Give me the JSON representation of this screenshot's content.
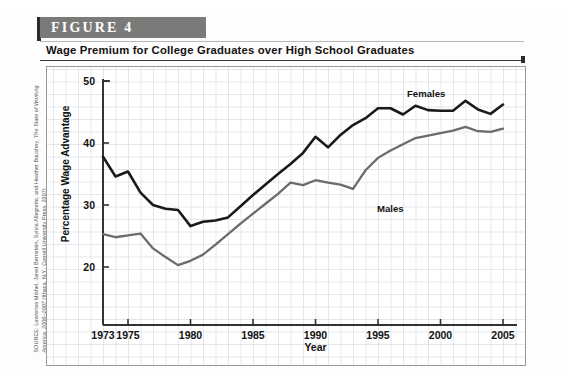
{
  "figure": {
    "banner_label": "FIGURE  4",
    "caption": "Wage Premium for College Graduates over High School Graduates"
  },
  "source": {
    "prefix": "SOURCE: Lawrence Mishel, Jared Bernstein, Sylvia Allegretto, and Heather Boushey, ",
    "italic_title": "The State of Working America, 2006–2007",
    "suffix": " (Ithaca, N.Y.: Cornell University Press, 2007)"
  },
  "chart_data": {
    "type": "line",
    "title": "Wage Premium for College Graduates over High School Graduates",
    "xlabel": "Year",
    "ylabel": "Percentage Wage Advantage",
    "xlim": [
      1973,
      2005
    ],
    "ylim": [
      14,
      52
    ],
    "ytick_labels": [
      "50",
      "40",
      "30",
      "20"
    ],
    "yticks": [
      50,
      40,
      30,
      20
    ],
    "xtick_labels": [
      "1973",
      "1975",
      "1980",
      "1985",
      "1990",
      "1995",
      "2000",
      "2005"
    ],
    "xticks": [
      1973,
      1975,
      1980,
      1985,
      1990,
      1995,
      2000,
      2005
    ],
    "grid": true,
    "legend_position": "inline-annotation",
    "x": [
      1973,
      1974,
      1975,
      1976,
      1977,
      1978,
      1979,
      1980,
      1981,
      1982,
      1983,
      1984,
      1985,
      1986,
      1987,
      1988,
      1989,
      1990,
      1991,
      1992,
      1993,
      1994,
      1995,
      1996,
      1997,
      1998,
      1999,
      2000,
      2001,
      2002,
      2003,
      2004,
      2005
    ],
    "series": [
      {
        "name": "Females",
        "color": "#1a1a1a",
        "label": "Females",
        "values": [
          37.8,
          34.6,
          35.4,
          32.0,
          30.0,
          29.4,
          29.2,
          26.6,
          27.3,
          27.5,
          28.0,
          29.8,
          31.6,
          33.3,
          35.0,
          36.6,
          38.4,
          41.0,
          39.3,
          41.3,
          42.9,
          44.0,
          45.6,
          45.6,
          44.6,
          46.0,
          45.3,
          45.2,
          45.2,
          46.8,
          45.4,
          44.7,
          46.2
        ]
      },
      {
        "name": "Males",
        "color": "#6b6b6b",
        "label": "Males",
        "values": [
          25.3,
          24.8,
          25.1,
          25.4,
          23.0,
          21.6,
          20.3,
          21.0,
          22.0,
          23.6,
          25.3,
          27.0,
          28.6,
          30.2,
          31.8,
          33.6,
          33.2,
          34.0,
          33.6,
          33.3,
          32.6,
          35.6,
          37.6,
          38.8,
          39.8,
          40.8,
          41.2,
          41.6,
          42.0,
          42.6,
          41.9,
          41.8,
          42.3
        ]
      }
    ]
  }
}
